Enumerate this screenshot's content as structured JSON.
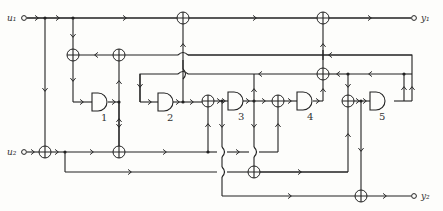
{
  "diagram": {
    "type": "logic-circuit",
    "inputs": [
      {
        "id": "u1",
        "label": "u₁"
      },
      {
        "id": "u2",
        "label": "u₂"
      }
    ],
    "outputs": [
      {
        "id": "y1",
        "label": "y₁"
      },
      {
        "id": "y2",
        "label": "y₂"
      }
    ],
    "gates": [
      {
        "id": "g1",
        "label": "1"
      },
      {
        "id": "g2",
        "label": "2"
      },
      {
        "id": "g3",
        "label": "3"
      },
      {
        "id": "g4",
        "label": "4"
      },
      {
        "id": "g5",
        "label": "5"
      }
    ],
    "adder_symbol": "⊕"
  }
}
